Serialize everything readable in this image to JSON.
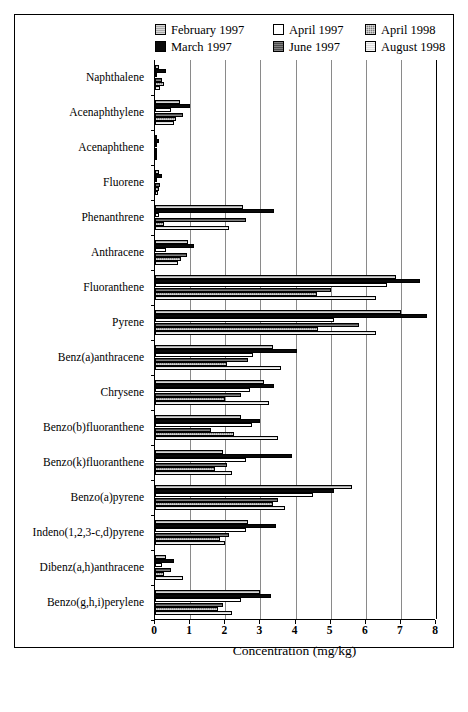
{
  "chart_data": {
    "type": "bar",
    "orientation": "horizontal",
    "title": "",
    "xlabel": "Concentration (mg/kg)",
    "ylabel": "",
    "xlim": [
      0,
      8
    ],
    "xticks": [
      "0",
      "1",
      "2",
      "3",
      "4",
      "5",
      "6",
      "7",
      "8"
    ],
    "grid": true,
    "legend_position": "top-inside",
    "categories": [
      "Naphthalene",
      "Acenaphthylene",
      "Acenaphthene",
      "Fluorene",
      "Phenanthrene",
      "Anthracene",
      "Fluoranthene",
      "Pyrene",
      "Benz(a)anthracene",
      "Chrysene",
      "Benzo(b)fluoranthene",
      "Benzo(k)fluoranthene",
      "Benzo(a)pyrene",
      "Indeno(1,2,3-c,d)pyrene",
      "Dibenz(a,h)anthracene",
      "Benzo(g,h,i)perylene"
    ],
    "series": [
      {
        "name": "February 1997",
        "swatch": "light-gray-hatch",
        "color": "#a8a8a8",
        "values": [
          0.1,
          0.7,
          0.05,
          0.1,
          2.5,
          0.95,
          6.85,
          7.0,
          3.35,
          3.1,
          2.45,
          1.95,
          5.6,
          2.65,
          0.3,
          3.0
        ]
      },
      {
        "name": "March 1997",
        "swatch": "solid-black",
        "color": "#0a0a0a",
        "values": [
          0.3,
          1.0,
          0.1,
          0.2,
          3.4,
          1.1,
          7.55,
          7.75,
          4.05,
          3.4,
          3.0,
          3.9,
          5.1,
          3.45,
          0.55,
          3.3
        ]
      },
      {
        "name": "April 1997",
        "swatch": "white-empty",
        "color": "#ffffff",
        "values": [
          0.05,
          0.45,
          0.03,
          0.05,
          0.12,
          0.3,
          6.6,
          5.1,
          2.8,
          2.7,
          2.75,
          2.6,
          4.5,
          2.6,
          0.2,
          2.45
        ]
      },
      {
        "name": "June 1997",
        "swatch": "dark-gray-hatch",
        "color": "#4a4a4a",
        "values": [
          0.2,
          0.8,
          0.05,
          0.15,
          2.6,
          0.9,
          5.0,
          5.8,
          2.65,
          2.45,
          1.6,
          2.05,
          3.5,
          2.1,
          0.45,
          1.95
        ]
      },
      {
        "name": "April 1998",
        "swatch": "medium-gray-checker",
        "color": "#7d7d7d",
        "values": [
          0.25,
          0.6,
          0.04,
          0.12,
          0.25,
          0.75,
          4.6,
          4.65,
          2.05,
          2.0,
          2.25,
          1.7,
          3.35,
          1.85,
          0.25,
          1.8
        ]
      },
      {
        "name": "August 1998",
        "swatch": "very-light-gray-hatch",
        "color": "#dcdcdc",
        "values": [
          0.15,
          0.55,
          0.03,
          0.08,
          2.1,
          0.65,
          6.3,
          6.3,
          3.6,
          3.25,
          3.5,
          2.2,
          3.7,
          2.0,
          0.8,
          2.2
        ]
      }
    ]
  },
  "legend": {
    "items": [
      {
        "label": "February 1997",
        "fill": "f-feb"
      },
      {
        "label": "April 1997",
        "fill": "f-apr97"
      },
      {
        "label": "April 1998",
        "fill": "f-apr98"
      },
      {
        "label": "March 1997",
        "fill": "f-mar"
      },
      {
        "label": "June 1997",
        "fill": "f-jun"
      },
      {
        "label": "August 1998",
        "fill": "f-aug"
      }
    ]
  }
}
